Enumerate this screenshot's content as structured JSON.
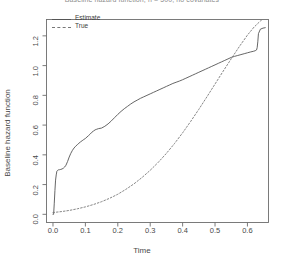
{
  "chart_data": {
    "type": "line",
    "title": "Baseline hazard function, n = 500, no covariates",
    "xlabel": "Time",
    "ylabel": "Baseline hazard function",
    "xlim": [
      -0.02,
      0.665
    ],
    "ylim": [
      -0.055,
      1.31
    ],
    "xticks": [
      "0.0",
      "0.1",
      "0.2",
      "0.3",
      "0.4",
      "0.5",
      "0.6"
    ],
    "xtick_values": [
      0.0,
      0.1,
      0.2,
      0.3,
      0.4,
      0.5,
      0.6
    ],
    "yticks": [
      "0.0",
      "0.2",
      "0.4",
      "0.6",
      "0.8",
      "1.0",
      "1.2"
    ],
    "ytick_values": [
      0.0,
      0.2,
      0.4,
      0.6,
      0.8,
      1.0,
      1.2
    ],
    "grid": false,
    "legend_position": "top-left",
    "box": true,
    "series": [
      {
        "name": "Estimate",
        "style": "solid",
        "color": "#555555",
        "x": [
          0.0,
          0.002,
          0.004,
          0.006,
          0.008,
          0.01,
          0.012,
          0.014,
          0.016,
          0.018,
          0.02,
          0.024,
          0.028,
          0.032,
          0.036,
          0.04,
          0.045,
          0.05,
          0.055,
          0.06,
          0.065,
          0.07,
          0.075,
          0.08,
          0.085,
          0.09,
          0.095,
          0.1,
          0.105,
          0.11,
          0.115,
          0.12,
          0.125,
          0.13,
          0.135,
          0.14,
          0.15,
          0.16,
          0.17,
          0.18,
          0.19,
          0.2,
          0.21,
          0.22,
          0.23,
          0.24,
          0.25,
          0.26,
          0.27,
          0.28,
          0.29,
          0.3,
          0.31,
          0.32,
          0.33,
          0.34,
          0.35,
          0.36,
          0.37,
          0.38,
          0.39,
          0.4,
          0.41,
          0.42,
          0.43,
          0.44,
          0.45,
          0.46,
          0.47,
          0.48,
          0.49,
          0.5,
          0.51,
          0.52,
          0.53,
          0.54,
          0.55,
          0.56,
          0.57,
          0.58,
          0.59,
          0.6,
          0.61,
          0.618,
          0.624,
          0.628,
          0.63,
          0.632,
          0.634,
          0.64,
          0.648,
          0.655
        ],
        "y": [
          0.0,
          0.0,
          0.075,
          0.16,
          0.23,
          0.265,
          0.29,
          0.295,
          0.298,
          0.3,
          0.3,
          0.302,
          0.305,
          0.31,
          0.318,
          0.33,
          0.355,
          0.385,
          0.41,
          0.43,
          0.446,
          0.458,
          0.468,
          0.478,
          0.487,
          0.495,
          0.503,
          0.51,
          0.52,
          0.53,
          0.54,
          0.552,
          0.56,
          0.568,
          0.572,
          0.576,
          0.58,
          0.592,
          0.608,
          0.628,
          0.65,
          0.672,
          0.692,
          0.71,
          0.726,
          0.742,
          0.756,
          0.768,
          0.78,
          0.79,
          0.8,
          0.81,
          0.82,
          0.83,
          0.84,
          0.85,
          0.86,
          0.87,
          0.88,
          0.888,
          0.896,
          0.905,
          0.915,
          0.925,
          0.935,
          0.945,
          0.955,
          0.965,
          0.975,
          0.985,
          0.995,
          1.005,
          1.015,
          1.025,
          1.035,
          1.045,
          1.055,
          1.062,
          1.068,
          1.074,
          1.08,
          1.086,
          1.092,
          1.096,
          1.1,
          1.105,
          1.12,
          1.16,
          1.215,
          1.245,
          1.252,
          1.255
        ]
      },
      {
        "name": "True",
        "style": "dashed",
        "color": "#777777",
        "x": [
          0.0,
          0.025,
          0.05,
          0.075,
          0.1,
          0.125,
          0.15,
          0.175,
          0.2,
          0.225,
          0.25,
          0.275,
          0.3,
          0.325,
          0.35,
          0.375,
          0.4,
          0.425,
          0.45,
          0.475,
          0.5,
          0.525,
          0.55,
          0.575,
          0.6,
          0.62,
          0.64,
          0.655
        ],
        "y": [
          0.012,
          0.018,
          0.026,
          0.037,
          0.05,
          0.066,
          0.085,
          0.108,
          0.135,
          0.168,
          0.205,
          0.248,
          0.296,
          0.35,
          0.41,
          0.476,
          0.548,
          0.625,
          0.706,
          0.79,
          0.876,
          0.962,
          1.046,
          1.128,
          1.205,
          1.258,
          1.3,
          1.325
        ]
      }
    ]
  },
  "legend": {
    "items": [
      {
        "label": "Estimate",
        "style": "solid"
      },
      {
        "label": "True",
        "style": "dashed"
      }
    ]
  }
}
